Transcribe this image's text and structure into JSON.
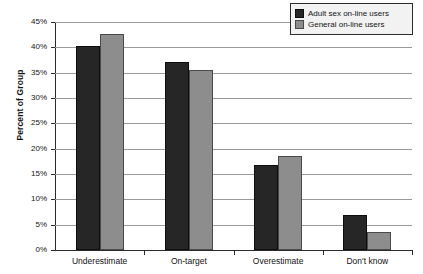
{
  "chart_data": {
    "type": "bar",
    "title": "",
    "subtitle": "",
    "xlabel": "",
    "ylabel": "Percent of Group",
    "ylim": [
      0,
      45
    ],
    "ytick_step": 5,
    "ytick_labels": [
      "0%",
      "5%",
      "10%",
      "15%",
      "20%",
      "25%",
      "30%",
      "35%",
      "40%",
      "45%"
    ],
    "ytick_values": [
      0,
      5,
      10,
      15,
      20,
      25,
      30,
      35,
      40,
      45
    ],
    "categories": [
      "Underestimate",
      "On-target",
      "Overestimate",
      "Don't know"
    ],
    "series": [
      {
        "name": "Adult sex on-line users",
        "color": "#262626",
        "values": [
          40.3,
          37.2,
          16.8,
          7.0
        ]
      },
      {
        "name": "General on-line users",
        "color": "#8d8d8d",
        "values": [
          42.6,
          35.5,
          18.6,
          3.5
        ]
      }
    ],
    "legend_position": "top-right",
    "grid": true,
    "grid_axis": "y",
    "grid_color": "#9a9a9a",
    "axis_color": "#2b2b2b",
    "background_color": "#ffffff",
    "value_unit": "percent"
  }
}
